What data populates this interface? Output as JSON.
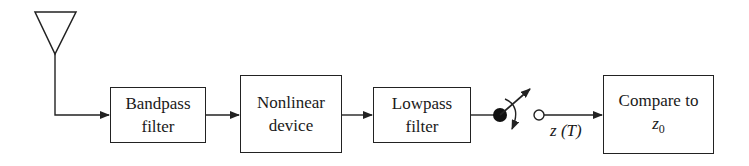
{
  "diagram": {
    "type": "block-diagram",
    "antenna": {
      "name": "antenna"
    },
    "blocks": [
      {
        "id": "bandpass",
        "line1": "Bandpass",
        "line2": "filter"
      },
      {
        "id": "nonlinear",
        "line1": "Nonlinear",
        "line2": "device"
      },
      {
        "id": "lowpass",
        "line1": "Lowpass",
        "line2": "filter"
      },
      {
        "id": "compare",
        "line1": "Compare to",
        "line2_var": "z",
        "line2_sub": "0"
      }
    ],
    "sampler": {
      "name": "sampling-switch"
    },
    "signal_label": {
      "var": "z",
      "arg": "(T)"
    }
  }
}
